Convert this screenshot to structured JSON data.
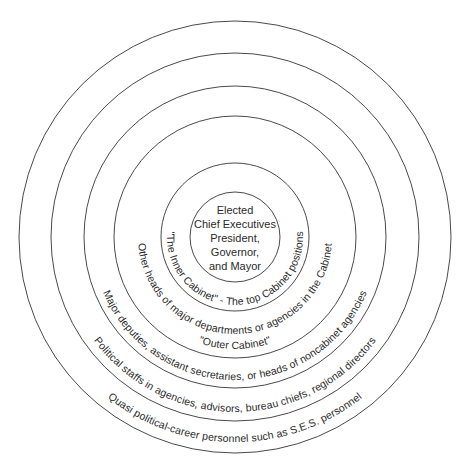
{
  "diagram": {
    "type": "concentric-circles",
    "center": {
      "x": 235,
      "y": 237
    },
    "ring_color": "#4a4a4a",
    "text_color": "#2a2a2a",
    "rings": [
      {
        "radius": 45
      },
      {
        "radius": 74
      },
      {
        "radius": 121
      },
      {
        "radius": 151
      },
      {
        "radius": 184
      },
      {
        "radius": 216
      }
    ],
    "core": {
      "lines": [
        "Elected",
        "Chief Executives",
        "President,",
        "Governor,",
        "and Mayor"
      ]
    },
    "layers": [
      {
        "id": "inner-cabinet",
        "text": "\"The Inner Cabinet\" - The top Cabinet positions"
      },
      {
        "id": "outer-cabinet-line1",
        "text": "Other heads of major departments or agencies in the Cabinet"
      },
      {
        "id": "outer-cabinet-line2",
        "text": "\"Outer Cabinet\""
      },
      {
        "id": "major-deputies",
        "text": "Major deputies, assistant secretaries, or heads of noncabinet agencies"
      },
      {
        "id": "political-staffs",
        "text": "Political staffs in agencies, advisors, bureau chiefs, regional directors"
      },
      {
        "id": "quasi-political",
        "text": "Quasi political-career personnel such as S.E.S. personnel"
      }
    ]
  }
}
